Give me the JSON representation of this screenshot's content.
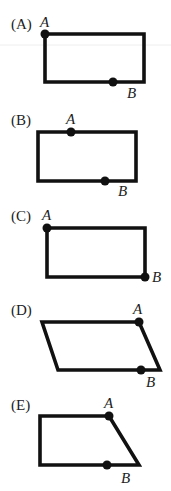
{
  "colors": {
    "ink": "#111111",
    "text": "#222222",
    "background": "#ffffff"
  },
  "options": [
    {
      "label": "(A)",
      "shape": "rectangle",
      "points": {
        "A": "top-left corner",
        "B": "bottom edge, right of center"
      },
      "point_labels": {
        "A": "A",
        "B": "B"
      }
    },
    {
      "label": "(B)",
      "shape": "rectangle",
      "points": {
        "A": "top edge, left third",
        "B": "bottom edge, right of center"
      },
      "point_labels": {
        "A": "A",
        "B": "B"
      }
    },
    {
      "label": "(C)",
      "shape": "rectangle",
      "points": {
        "A": "top-left corner",
        "B": "bottom-right corner"
      },
      "point_labels": {
        "A": "A",
        "B": "B"
      }
    },
    {
      "label": "(D)",
      "shape": "parallelogram",
      "points": {
        "A": "top-right corner",
        "B": "bottom edge, near right end"
      },
      "point_labels": {
        "A": "A",
        "B": "B"
      }
    },
    {
      "label": "(E)",
      "shape": "trapezoid",
      "points": {
        "A": "top-right corner",
        "B": "bottom edge, right of center"
      },
      "point_labels": {
        "A": "A",
        "B": "B"
      }
    }
  ]
}
